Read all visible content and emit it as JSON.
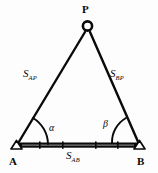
{
  "figure": {
    "type": "triangulation-diagram",
    "background_color": "#fdfdfd",
    "ink_color": "#0a0a0a"
  },
  "vertices": {
    "apex": {
      "label": "P",
      "marker": "circle-station-marker",
      "x": 87,
      "y": 28
    },
    "left": {
      "label": "A",
      "marker": "triangle-station-marker",
      "x": 16,
      "y": 145
    },
    "right": {
      "label": "B",
      "marker": "triangle-station-marker",
      "x": 140,
      "y": 145
    }
  },
  "sides": {
    "left_side": {
      "symbol": "S",
      "subscript": "AP",
      "full_label": "S_AP"
    },
    "right_side": {
      "symbol": "S",
      "subscript": "BP",
      "full_label": "S_BP"
    },
    "baseline": {
      "symbol": "S",
      "subscript": "AB",
      "full_label": "S_AB",
      "style": "thick-measured-bar"
    }
  },
  "angles": {
    "at_A": {
      "label": "α",
      "name": "alpha"
    },
    "at_B": {
      "label": "β",
      "name": "beta"
    }
  }
}
